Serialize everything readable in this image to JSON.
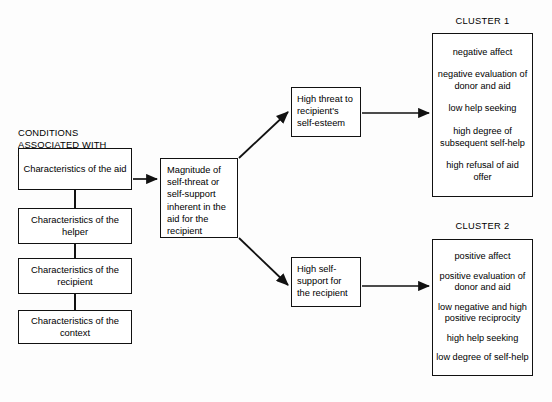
{
  "heading": {
    "text": "CONDITIONS\nASSOCIATED WITH\nTHE RECEIPT OF AID"
  },
  "conditions": {
    "items": [
      {
        "label": "Characteristics of the aid"
      },
      {
        "label": "Characteristics of the helper"
      },
      {
        "label": "Characteristics of the recipient"
      },
      {
        "label": "Characteristics of the context"
      }
    ]
  },
  "center": {
    "label": "Magnitude of self-threat or self-support inherent in the aid for the recipient"
  },
  "stages": {
    "threat": {
      "label": "High threat to recipient's self-esteem"
    },
    "support": {
      "label": "High self-support for the recipient"
    }
  },
  "clusters": [
    {
      "title": "CLUSTER 1",
      "items": [
        "negative affect",
        "negative evaluation of donor and aid",
        "low help seeking",
        "high degree of subsequent self-help",
        "high refusal of aid offer"
      ]
    },
    {
      "title": "CLUSTER 2",
      "items": [
        "positive affect",
        "positive evaluation of donor and aid",
        "low negative and high positive reciprocity",
        "high help seeking",
        "low degree of self-help"
      ]
    }
  ],
  "colors": {
    "stroke": "#111111",
    "background": "#fdfdfd",
    "box_fill": "#ffffff"
  }
}
